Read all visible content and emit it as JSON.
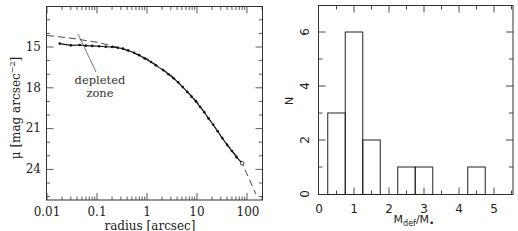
{
  "chart_data": [
    {
      "type": "scatter",
      "title": "",
      "xlabel": "radius [arcsec]",
      "ylabel": "μ [mag arcsec^-2]",
      "xscale": "log",
      "xlim": [
        0.01,
        150
      ],
      "ylim": [
        26.2,
        12.1
      ],
      "y_inverted": true,
      "xticks": [
        "0.01",
        "0.1",
        "1",
        "10",
        "100"
      ],
      "yticks": [
        "15",
        "18",
        "21",
        "24"
      ],
      "grid": false,
      "annotation": {
        "text_line1": "depleted",
        "text_line2": "zone",
        "points_to": [
          0.045,
          14.4
        ]
      },
      "series": [
        {
          "name": "observed profile",
          "style": "points+solid line",
          "x": [
            0.018,
            0.03,
            0.045,
            0.06,
            0.08,
            0.11,
            0.15,
            0.2,
            0.26,
            0.33,
            0.42,
            0.55,
            0.7,
            0.9,
            1.2,
            1.5,
            2.1,
            2.7,
            3.4,
            4.2,
            5.2,
            6.4,
            7.8,
            9.5,
            11.5,
            14,
            17,
            21,
            26,
            32,
            40,
            50,
            62,
            80
          ],
          "y": [
            14.75,
            14.88,
            14.85,
            14.9,
            14.92,
            14.95,
            14.98,
            15.0,
            15.05,
            15.12,
            15.25,
            15.42,
            15.6,
            15.85,
            16.1,
            16.35,
            16.7,
            17.0,
            17.3,
            17.6,
            17.95,
            18.3,
            18.65,
            19.0,
            19.4,
            19.8,
            20.25,
            20.7,
            21.2,
            21.7,
            22.2,
            22.65,
            23.1,
            23.55
          ]
        },
        {
          "name": "Sersic fit",
          "style": "dashed line",
          "x": [
            0.01,
            0.03,
            0.1,
            0.3,
            1,
            3,
            10,
            30,
            80,
            150
          ],
          "y": [
            14.15,
            14.35,
            14.65,
            15.08,
            15.85,
            17.05,
            19.0,
            21.55,
            23.55,
            25.8
          ]
        }
      ]
    },
    {
      "type": "bar",
      "subtype": "histogram",
      "title": "",
      "xlabel": "M_def/M_•",
      "ylabel": "N",
      "xlim": [
        0,
        5.5
      ],
      "ylim": [
        0,
        7
      ],
      "xticks": [
        "0",
        "1",
        "2",
        "3",
        "4",
        "5"
      ],
      "yticks": [
        "0",
        "2",
        "4",
        "6"
      ],
      "grid": false,
      "bin_width": 0.5,
      "bins": [
        {
          "x0": 0.25,
          "x1": 0.75,
          "count": 3
        },
        {
          "x0": 0.75,
          "x1": 1.25,
          "count": 6
        },
        {
          "x0": 1.25,
          "x1": 1.75,
          "count": 2
        },
        {
          "x0": 2.25,
          "x1": 2.75,
          "count": 1
        },
        {
          "x0": 2.75,
          "x1": 3.25,
          "count": 1
        },
        {
          "x0": 4.25,
          "x1": 4.75,
          "count": 1
        }
      ],
      "categories": [
        "0.25-0.75",
        "0.75-1.25",
        "1.25-1.75",
        "2.25-2.75",
        "2.75-3.25",
        "4.25-4.75"
      ],
      "values": [
        3,
        6,
        2,
        1,
        1,
        1
      ]
    }
  ],
  "left": {
    "xlabel": "radius [arcsec]",
    "ylabel_main": "μ [mag arcsec",
    "ylabel_sup": "−2",
    "ylabel_close": "]",
    "xticks": [
      "0.01",
      "0.1",
      "1",
      "10",
      "100"
    ],
    "yticks": [
      "15",
      "18",
      "21",
      "24"
    ],
    "annotation_line1": "depleted",
    "annotation_line2": "zone"
  },
  "right": {
    "xlabel_main": "M",
    "xlabel_sub": "def",
    "xlabel_slash": "/M",
    "xlabel_sub2": "•",
    "ylabel": "N",
    "xticks": [
      "0",
      "1",
      "2",
      "3",
      "4",
      "5"
    ],
    "yticks": [
      "0",
      "2",
      "4",
      "6"
    ]
  }
}
